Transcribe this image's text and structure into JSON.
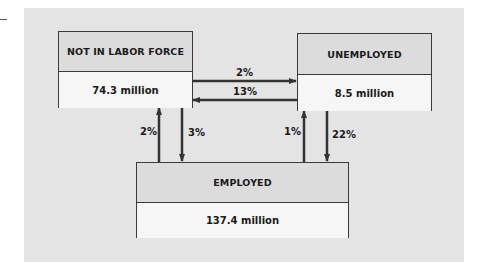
{
  "diagram": {
    "nodes": [
      {
        "id": "nlf",
        "title": "NOT IN LABOR FORCE",
        "value": "74.3 million"
      },
      {
        "id": "unemp",
        "title": "UNEMPLOYED",
        "value": "8.5 million"
      },
      {
        "id": "emp",
        "title": "EMPLOYED",
        "value": "137.4 million"
      }
    ],
    "flows": [
      {
        "from": "NOT IN LABOR FORCE",
        "to": "UNEMPLOYED",
        "label": "2%"
      },
      {
        "from": "UNEMPLOYED",
        "to": "NOT IN LABOR FORCE",
        "label": "13%"
      },
      {
        "from": "EMPLOYED",
        "to": "NOT IN LABOR FORCE",
        "label": "2%"
      },
      {
        "from": "NOT IN LABOR FORCE",
        "to": "EMPLOYED",
        "label": "3%"
      },
      {
        "from": "EMPLOYED",
        "to": "UNEMPLOYED",
        "label": "1%"
      },
      {
        "from": "UNEMPLOYED",
        "to": "EMPLOYED",
        "label": "22%"
      }
    ],
    "colors": {
      "panel": "#e4e4e4",
      "box_header": "#dcdcdc",
      "box_value": "#f6f6f6",
      "line": "#3a3a3a"
    }
  }
}
